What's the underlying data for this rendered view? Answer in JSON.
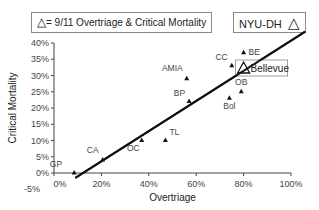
{
  "chart_data": {
    "type": "scatter",
    "title": "",
    "xlabel": "Overtriage",
    "ylabel": "Critical Mortality",
    "xlim": [
      0,
      100
    ],
    "ylim": [
      -5,
      40
    ],
    "x_ticks": [
      "0%",
      "20%",
      "40%",
      "60%",
      "80%",
      "100%"
    ],
    "y_ticks": [
      "-5%",
      "0%",
      "5%",
      "10%",
      "15%",
      "20%",
      "25%",
      "30%",
      "35%",
      "40%"
    ],
    "grid": false,
    "legend": [
      {
        "marker": "open-triangle",
        "label": "= 9/11 Overtriage & Critical Mortality"
      },
      {
        "marker": "open-triangle",
        "label": "NYU-DH"
      }
    ],
    "series": [
      {
        "name": "Other events",
        "marker": "filled-triangle",
        "points": [
          {
            "label": "GP",
            "x": 8.5,
            "y": 0
          },
          {
            "label": "CA",
            "x": 20.5,
            "y": 4
          },
          {
            "label": "OC",
            "x": 37,
            "y": 10
          },
          {
            "label": "TL",
            "x": 47,
            "y": 10
          },
          {
            "label": "BP",
            "x": 57,
            "y": 22
          },
          {
            "label": "AMIA",
            "x": 56,
            "y": 29
          },
          {
            "label": "Bol",
            "x": 74,
            "y": 23
          },
          {
            "label": "OB",
            "x": 79,
            "y": 25
          },
          {
            "label": "CC",
            "x": 75,
            "y": 33
          },
          {
            "label": "BE",
            "x": 80,
            "y": 37
          }
        ]
      },
      {
        "name": "9/11 Bellevue",
        "marker": "open-triangle",
        "points": [
          {
            "label": "Bellevue",
            "x": 80,
            "y": 32
          }
        ]
      }
    ],
    "trendline": {
      "x": [
        9,
        106
      ],
      "y": [
        -1.5,
        43.5
      ]
    }
  },
  "legend": {
    "main_label": "= 9/11 Overtriage & Critical Mortality",
    "nyu_label": "NYU-DH"
  }
}
